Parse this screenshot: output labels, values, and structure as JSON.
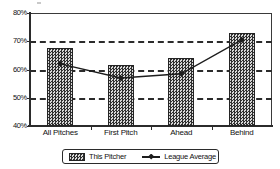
{
  "chart_data": {
    "type": "bar",
    "title": "",
    "subtitle": "",
    "xlabel": "",
    "ylabel": "",
    "categories": [
      "All Pitches",
      "First Pitch",
      "Ahead",
      "Behind"
    ],
    "ylim": [
      40,
      80
    ],
    "ytick_labels": [
      "40%",
      "50%",
      "60%",
      "70%",
      "80%"
    ],
    "ytick_values": [
      40,
      50,
      60,
      70,
      80
    ],
    "gridlines": [
      50,
      60,
      70
    ],
    "grid": true,
    "legend_position": "bottom-center",
    "series": [
      {
        "name": "This Pitcher",
        "type": "bar",
        "values": [
          67.5,
          61.5,
          64.0,
          73.0
        ],
        "color": "#2f2f2f",
        "fill": "cross-hatch"
      },
      {
        "name": "League Average",
        "type": "line",
        "values": [
          62.0,
          57.0,
          58.5,
          70.5
        ],
        "color": "#1d1d1d",
        "marker": "diamond"
      }
    ]
  },
  "legend": {
    "items": [
      {
        "label": "This Pitcher",
        "marker": "hatched-swatch"
      },
      {
        "label": "League Average",
        "marker": "line-with-diamond"
      }
    ]
  },
  "axes": {
    "y_ticks": [
      "80%",
      "70%",
      "60%",
      "50%",
      "40%"
    ],
    "x_ticks": [
      "All Pitches",
      "First Pitch",
      "Ahead",
      "Behind"
    ]
  }
}
